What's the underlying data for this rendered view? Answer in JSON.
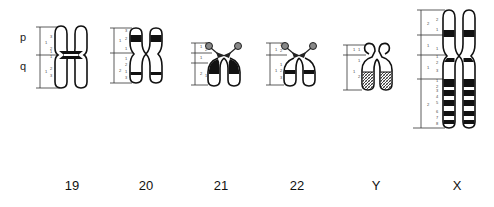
{
  "figure": {
    "arm_labels": {
      "p": "p",
      "q": "q"
    },
    "chromosomes": [
      {
        "name": "19",
        "label": "19",
        "p_regions": [
          {
            "region": "1",
            "bands": [
              "3",
              "2",
              "1"
            ]
          }
        ],
        "q_regions": [
          {
            "region": "1",
            "bands": [
              "2",
              "3"
            ]
          }
        ],
        "dark_bands": [
          "p-centromere",
          "q-centromere"
        ],
        "type": "metacentric"
      },
      {
        "name": "20",
        "label": "20",
        "p_regions": [
          {
            "region": "1",
            "bands": [
              "3",
              "2",
              "1"
            ]
          }
        ],
        "q_regions": [
          {
            "region": "1",
            "bands": [
              "1",
              "2"
            ]
          },
          {
            "region": "2",
            "bands": [
              "1",
              "2",
              "3"
            ]
          }
        ],
        "dark_bands": [
          "p12",
          "q13"
        ],
        "type": "metacentric"
      },
      {
        "name": "21",
        "label": "21",
        "p_regions": [
          {
            "region": "1",
            "bands": [
              "1",
              "2",
              "3"
            ]
          }
        ],
        "q_regions": [
          {
            "region": "1",
            "bands": [
              "1"
            ]
          },
          {
            "region": "2",
            "bands": [
              "1",
              "2"
            ]
          }
        ],
        "dark_bands": [
          "q21"
        ],
        "type": "acrocentric-satellite"
      },
      {
        "name": "22",
        "label": "22",
        "p_regions": [
          {
            "region": "1",
            "bands": [
              "1",
              "2",
              "3"
            ]
          }
        ],
        "q_regions": [
          {
            "region": "1",
            "bands": [
              "1",
              "2",
              "3"
            ]
          }
        ],
        "dark_bands": [
          "q12"
        ],
        "type": "acrocentric-satellite"
      },
      {
        "name": "Y",
        "label": "Y",
        "p_regions": [
          {
            "region": "1",
            "bands": [
              "1",
              "1"
            ]
          }
        ],
        "q_regions": [
          {
            "region": "1",
            "bands": [
              "1",
              "2"
            ]
          }
        ],
        "dark_bands": [
          "q12-hatched"
        ],
        "type": "y-heterochromatic"
      },
      {
        "name": "X",
        "label": "X",
        "p_regions": [
          {
            "region": "2",
            "bands": [
              "2",
              "1"
            ]
          },
          {
            "region": "1",
            "bands": [
              "1"
            ]
          }
        ],
        "q_regions": [
          {
            "region": "1",
            "bands": [
              "2",
              "3"
            ]
          },
          {
            "region": "2",
            "bands": [
              "1",
              "2",
              "3",
              "4",
              "5",
              "6",
              "7",
              "8"
            ]
          }
        ],
        "dark_bands": [
          "p21",
          "q13",
          "q21",
          "q23",
          "q25",
          "q27"
        ],
        "type": "submetacentric"
      }
    ]
  }
}
